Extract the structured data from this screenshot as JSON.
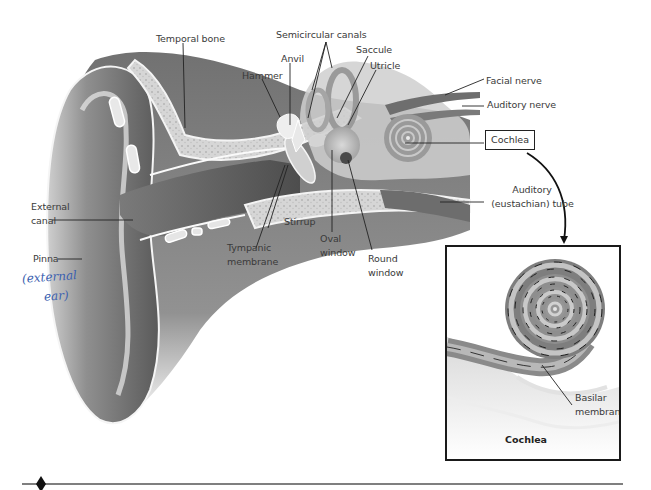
{
  "diagram": {
    "labels": {
      "temporal_bone": "Temporal bone",
      "semicircular_canals": "Semicircular canals",
      "anvil": "Anvil",
      "hammer": "Hammer",
      "saccule": "Saccule",
      "utricle": "Utricle",
      "facial_nerve": "Facial nerve",
      "auditory_nerve": "Auditory nerve",
      "cochlea_box": "Cochlea",
      "auditory_tube_line1": "Auditory",
      "auditory_tube_line2": "(eustachian) tube",
      "external_canal_line1": "External",
      "external_canal_line2": "canal",
      "pinna": "Pinna",
      "stirrup": "Stirrup",
      "tympanic_line1": "Tympanic",
      "tympanic_line2": "membrane",
      "oval_line1": "Oval",
      "oval_line2": "window",
      "round_line1": "Round",
      "round_line2": "window"
    },
    "handwritten_note": {
      "line1": "(external",
      "line2": "ear)",
      "color": "#3b5fb0"
    },
    "inset": {
      "title": "Cochlea",
      "label_line1": "Basilar",
      "label_line2": "membrane"
    }
  },
  "colors": {
    "tissue_dark": "#5e5e5e",
    "tissue_mid": "#8a8a8a",
    "tissue_light": "#c4c4c4",
    "bone": "#d8d8d8",
    "leader_line": "#222222",
    "frame": "#1a1a1a"
  }
}
